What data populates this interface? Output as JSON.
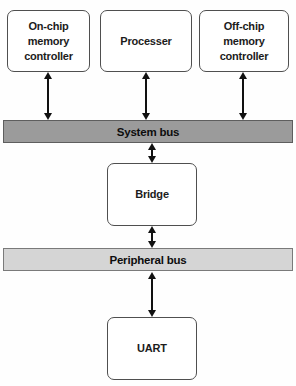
{
  "nodes": {
    "onchip": {
      "label": "On-chip\nmemory\ncontroller"
    },
    "processer": {
      "label": "Processer"
    },
    "offchip": {
      "label": "Off-chip\nmemory\ncontroller"
    },
    "bridge": {
      "label": "Bridge"
    },
    "uart": {
      "label": "UART"
    }
  },
  "buses": {
    "system": {
      "label": "System bus",
      "fill": "#9b9b9b",
      "border": "#5e5e5e"
    },
    "peripheral": {
      "label": "Peripheral bus",
      "fill": "#d5d5d5",
      "border": "#7a7a7a"
    }
  },
  "colors": {
    "background": "#fefefe",
    "box_fill": "#ffffff",
    "box_border": "#4f4f4f",
    "text": "#1c1c1c",
    "arrow": "#111111"
  }
}
